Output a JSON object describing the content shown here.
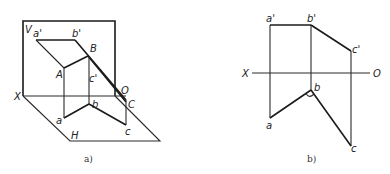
{
  "figure_a": {
    "caption": "a)",
    "labels": {
      "V": "V",
      "a_prime": "a'",
      "b_prime": "b'",
      "B": "B",
      "A": "A",
      "c_prime": "c'",
      "X": "X",
      "O": "O",
      "C": "C",
      "b": "b",
      "a": "a",
      "c": "c",
      "H": "H"
    }
  },
  "figure_b": {
    "caption": "b)",
    "labels": {
      "a_prime": "a'",
      "b_prime": "b'",
      "c_prime": "c'",
      "X": "X",
      "O": "O",
      "b": "b",
      "a": "a",
      "c": "c"
    }
  }
}
